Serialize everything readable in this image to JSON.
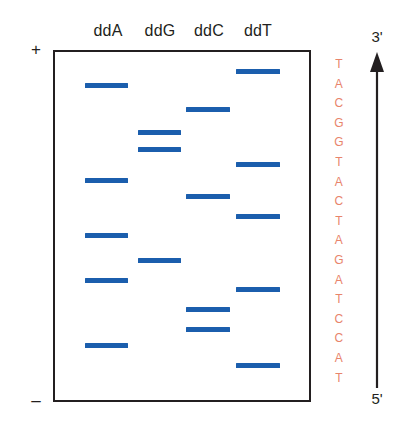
{
  "figure": {
    "colors": {
      "band": "#1b5ead",
      "sequence_text": "#e8846b",
      "outline": "#231f20"
    }
  },
  "gel": {
    "polarity_top": "+",
    "polarity_bottom": "–",
    "lanes": [
      {
        "label": "ddA",
        "label_x": 108,
        "lane_left": 85,
        "lane_width": 43,
        "bands_y": [
          83,
          178,
          233,
          278,
          343
        ]
      },
      {
        "label": "ddG",
        "label_x": 160,
        "lane_left": 138,
        "lane_width": 43,
        "bands_y": [
          130,
          147,
          258
        ]
      },
      {
        "label": "ddC",
        "label_x": 209,
        "lane_left": 186,
        "lane_width": 44,
        "bands_y": [
          107,
          194,
          307,
          327
        ]
      },
      {
        "label": "ddT",
        "label_x": 258,
        "lane_left": 236,
        "lane_width": 44,
        "bands_y": [
          69,
          162,
          214,
          287,
          363
        ]
      }
    ]
  },
  "sequence": {
    "top_prime": "3'",
    "bottom_prime": "5'",
    "direction": "up",
    "bases": [
      "T",
      "A",
      "C",
      "G",
      "G",
      "T",
      "A",
      "C",
      "T",
      "A",
      "G",
      "A",
      "T",
      "C",
      "C",
      "A",
      "T"
    ]
  }
}
